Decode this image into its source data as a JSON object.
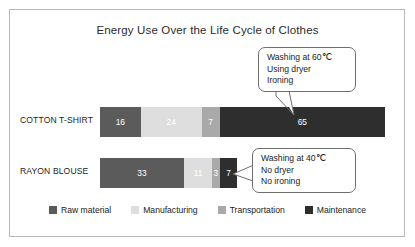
{
  "chart_data": {
    "type": "bar",
    "orientation": "horizontal-stacked",
    "title": "Energy Use Over the Life Cycle of Clothes",
    "xlabel": "",
    "ylabel": "",
    "grid": false,
    "legend_position": "bottom",
    "categories": [
      "COTTON T-SHIRT",
      "RAYON BLOUSE"
    ],
    "series": [
      {
        "name": "Raw material",
        "color": "#5b5b5b",
        "values": [
          16,
          33
        ]
      },
      {
        "name": "Manufacturing",
        "color": "#dedede",
        "values": [
          24,
          11
        ]
      },
      {
        "name": "Transportation",
        "color": "#a9a9a9",
        "values": [
          7,
          3
        ]
      },
      {
        "name": "Maintenance",
        "color": "#2e2e2e",
        "values": [
          65,
          7
        ]
      }
    ],
    "totals": [
      112,
      54
    ],
    "annotations": [
      {
        "target": "COTTON T-SHIRT",
        "lines": [
          "Washing at 60℃",
          "Using dryer",
          "Ironing"
        ]
      },
      {
        "target": "RAYON BLOUSE",
        "lines": [
          "Washing at 40℃",
          "No dryer",
          "No ironing"
        ]
      }
    ]
  },
  "chart": {
    "title": "Energy Use Over the Life Cycle of Clothes",
    "rows": [
      {
        "label": "COTTON T-SHIRT",
        "segments": [
          {
            "label": "16",
            "value": 16,
            "color": "#5b5b5b",
            "text_color": "#ffffff"
          },
          {
            "label": "24",
            "value": 24,
            "color": "#dedede",
            "text_color": "#ffffff"
          },
          {
            "label": "7",
            "value": 7,
            "color": "#a9a9a9",
            "text_color": "#ffffff"
          },
          {
            "label": "65",
            "value": 65,
            "color": "#2e2e2e",
            "text_color": "#ffffff"
          }
        ]
      },
      {
        "label": "RAYON BLOUSE",
        "segments": [
          {
            "label": "33",
            "value": 33,
            "color": "#5b5b5b",
            "text_color": "#ffffff"
          },
          {
            "label": "11",
            "value": 11,
            "color": "#dedede",
            "text_color": "#ffffff"
          },
          {
            "label": "3",
            "value": 3,
            "color": "#a9a9a9",
            "text_color": "#ffffff"
          },
          {
            "label": "7",
            "value": 7,
            "color": "#2e2e2e",
            "text_color": "#ffffff"
          }
        ]
      }
    ],
    "callouts": [
      {
        "name": "cotton",
        "line1": "Washing at 60℃",
        "line2": "Using dryer",
        "line3": "Ironing"
      },
      {
        "name": "rayon",
        "line1": "Washing at 40℃",
        "line2": "No dryer",
        "line3": "No ironing"
      }
    ],
    "legend": [
      {
        "label": "Raw material",
        "color": "#5b5b5b"
      },
      {
        "label": "Manufacturing",
        "color": "#dedede"
      },
      {
        "label": "Transportation",
        "color": "#a9a9a9"
      },
      {
        "label": "Maintenance",
        "color": "#2e2e2e"
      }
    ]
  }
}
